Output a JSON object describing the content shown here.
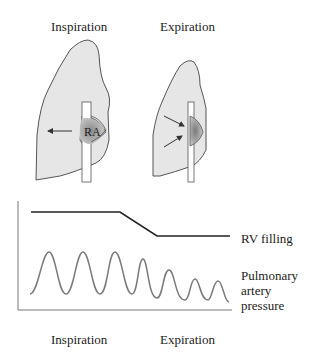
{
  "top": {
    "left_title": "Inspiration",
    "right_title": "Expiration",
    "ra_label": "RA"
  },
  "graph": {
    "rv_label": "RV filling",
    "pa_label_line1": "Pulmonary",
    "pa_label_line2": "artery",
    "pa_label_line3": "pressure",
    "bottom_left": "Inspiration",
    "bottom_right": "Expiration"
  },
  "colors": {
    "lung_fill": "#e6e6e6",
    "outline": "#555555",
    "rv_line": "#222222",
    "pa_wave": "#7a7a7a"
  }
}
